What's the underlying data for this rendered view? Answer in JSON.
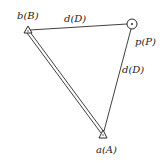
{
  "diagram": {
    "type": "survey-triangle",
    "colors": {
      "line": "#2a2a2a",
      "background": "#ffffff",
      "text": "#222222"
    },
    "points": [
      {
        "id": "B",
        "label": "b(B)",
        "symbol": "triangle-station",
        "x": 28,
        "y": 31
      },
      {
        "id": "P",
        "label": "p(P)",
        "symbol": "circle-point",
        "x": 132,
        "y": 24
      },
      {
        "id": "A",
        "label": "a(A)",
        "symbol": "triangle-station",
        "x": 103,
        "y": 135
      }
    ],
    "edges": [
      {
        "from": "B",
        "to": "P",
        "label": "d(D)",
        "style": "single"
      },
      {
        "from": "P",
        "to": "A",
        "label": "d(D)",
        "style": "single"
      },
      {
        "from": "B",
        "to": "A",
        "label": "",
        "style": "double"
      }
    ],
    "labels": {
      "b": "b(B)",
      "p": "p(P)",
      "a": "a(A)",
      "d_top": "d(D)",
      "d_right": "d(D)"
    }
  }
}
